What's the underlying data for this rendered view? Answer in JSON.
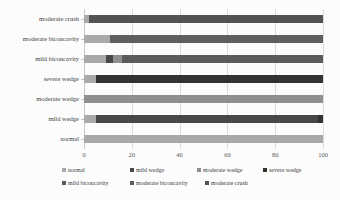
{
  "chart_data": {
    "type": "bar",
    "orientation": "horizontal",
    "stacked": true,
    "title": "",
    "xlabel": "",
    "ylabel": "",
    "xlim": [
      0,
      100
    ],
    "xticks": [
      0,
      20,
      40,
      60,
      80,
      100
    ],
    "grid": "vertical-light-gray",
    "legend_position": "bottom",
    "categories_top_to_bottom": [
      "moderate crush",
      "moderate biconcavity",
      "mild biconcavity",
      "severe wedge",
      "moderate wedge",
      "mild wedge",
      "normal"
    ],
    "series": [
      {
        "name": "normal",
        "color": "#a9a9a9"
      },
      {
        "name": "mild wedge",
        "color": "#484848"
      },
      {
        "name": "moderate wedge",
        "color": "#8f8f8f"
      },
      {
        "name": "severe wedge",
        "color": "#323232"
      },
      {
        "name": "mild biconcavity",
        "color": "#5b5b5b"
      },
      {
        "name": "moderate biconcavity",
        "color": "#5f5f5f"
      },
      {
        "name": "moderate crush",
        "color": "#535353"
      }
    ],
    "rows": [
      {
        "category": "moderate crush",
        "segments": [
          {
            "series": "normal",
            "value": 2
          },
          {
            "series": "moderate crush",
            "value": 98
          }
        ]
      },
      {
        "category": "moderate biconcavity",
        "segments": [
          {
            "series": "normal",
            "value": 11
          },
          {
            "series": "moderate biconcavity",
            "value": 89
          }
        ]
      },
      {
        "category": "mild biconcavity",
        "segments": [
          {
            "series": "normal",
            "value": 9
          },
          {
            "series": "mild wedge",
            "value": 3
          },
          {
            "series": "moderate wedge",
            "value": 4
          },
          {
            "series": "mild biconcavity",
            "value": 84
          }
        ]
      },
      {
        "category": "severe wedge",
        "segments": [
          {
            "series": "normal",
            "value": 5
          },
          {
            "series": "severe wedge",
            "value": 95
          }
        ]
      },
      {
        "category": "moderate wedge",
        "segments": [
          {
            "series": "moderate wedge",
            "value": 100
          }
        ]
      },
      {
        "category": "mild wedge",
        "segments": [
          {
            "series": "normal",
            "value": 5
          },
          {
            "series": "mild wedge",
            "value": 93
          },
          {
            "series": "severe wedge",
            "value": 2
          }
        ]
      },
      {
        "category": "normal",
        "segments": [
          {
            "series": "normal",
            "value": 100
          }
        ]
      }
    ],
    "legend_rows": [
      [
        "normal",
        "mild wedge",
        "moderate wedge",
        "severe wedge"
      ],
      [
        "mild biconcavity",
        "moderate biconcavity",
        "moderate crush"
      ]
    ]
  }
}
